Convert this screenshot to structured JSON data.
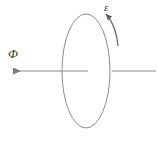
{
  "figure": {
    "type": "physics-diagram",
    "background_color": "#ffffff",
    "stroke_color": "#8c8c8c",
    "label_color": "#3a3a3a"
  },
  "labels": {
    "flux": "Φ",
    "emf": "ε"
  },
  "elements": {
    "loop": {
      "name": "conducting-loop",
      "shape": "ellipse",
      "center_x": 86,
      "center_y": 71,
      "radius_x": 24,
      "radius_y": 57,
      "stroke": "#8c8c8c",
      "stroke_width": 1,
      "fill": "none"
    },
    "flux_axis_left": {
      "name": "flux-arrow",
      "x1": 88,
      "y1": 71,
      "x2": 12,
      "y2": 71,
      "arrowhead": "left",
      "stroke": "#8c8c8c"
    },
    "flux_axis_right": {
      "name": "axis-line-right",
      "x1": 112,
      "y1": 71,
      "x2": 156,
      "y2": 71,
      "arrowhead": "none",
      "stroke": "#8c8c8c"
    },
    "emf_arc": {
      "name": "emf-curved-arrow",
      "start_x": 118,
      "start_y": 46,
      "end_x": 105,
      "end_y": 13,
      "arrowhead": "end-upper-left",
      "stroke": "#6b6b6b"
    }
  }
}
